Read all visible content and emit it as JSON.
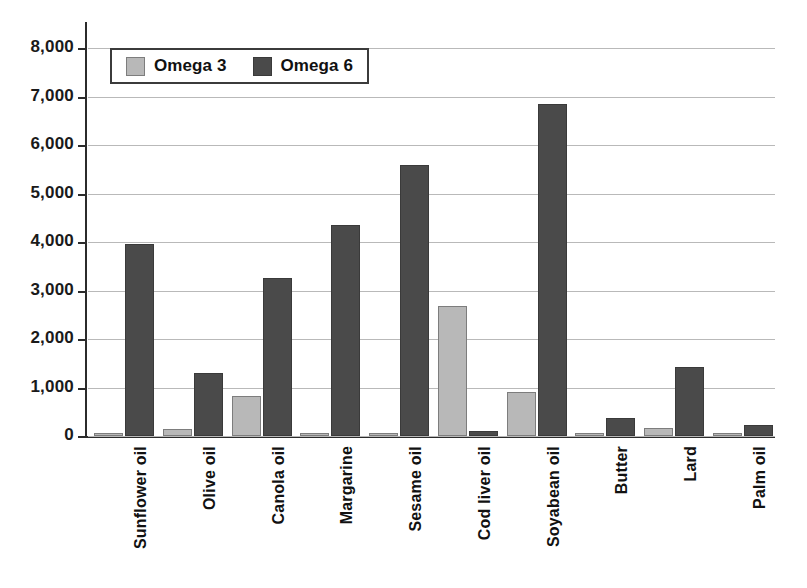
{
  "chart_data": {
    "type": "bar",
    "title": "",
    "subtitle": "",
    "xlabel": "",
    "ylabel": "",
    "ylim": [
      0,
      8000
    ],
    "grid": true,
    "legend_position": "top-left",
    "y_ticks": [
      "0",
      "1,000",
      "2,000",
      "3,000",
      "4,000",
      "5,000",
      "6,000",
      "7,000",
      "8,000"
    ],
    "y_tick_values": [
      0,
      1000,
      2000,
      3000,
      4000,
      5000,
      6000,
      7000,
      8000
    ],
    "categories": [
      "Sunflower oil",
      "Olive oil",
      "Canola oil",
      "Margarine",
      "Sesame oil",
      "Cod liver oil",
      "Soyabean oil",
      "Butter",
      "Lard",
      "Palm oil"
    ],
    "series": [
      {
        "name": "Omega 3",
        "color": "#b8b8b8",
        "values": [
          30,
          150,
          820,
          55,
          60,
          2680,
          900,
          40,
          170,
          45
        ]
      },
      {
        "name": "Omega 6",
        "color": "#4a4a4a",
        "values": [
          3950,
          1300,
          3250,
          4350,
          5580,
          110,
          6850,
          370,
          1420,
          230
        ]
      }
    ]
  },
  "legend": {
    "entries": [
      {
        "label": "Omega 3",
        "swatch": "omega3"
      },
      {
        "label": "Omega 6",
        "swatch": "omega6"
      }
    ]
  },
  "colors": {
    "omega3": "#b8b8b8",
    "omega6": "#4a4a4a",
    "axis": "#2b2b2b",
    "gridline": "#b9b9b9",
    "background": "#ffffff",
    "text": "#111111"
  }
}
